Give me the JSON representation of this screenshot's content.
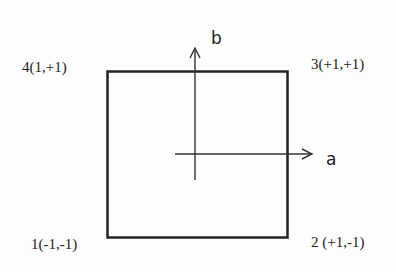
{
  "diagram": {
    "type": "square-with-local-axes",
    "stroke_color": "#222222",
    "background": "#fdfdfd",
    "axes": {
      "horizontal": {
        "label": "a"
      },
      "vertical": {
        "label": "b"
      }
    },
    "corners": [
      {
        "id": 1,
        "position": "bottom-left",
        "label": "1(-1,-1)"
      },
      {
        "id": 2,
        "position": "bottom-right",
        "label": "2 (+1,-1)"
      },
      {
        "id": 3,
        "position": "top-right",
        "label": "3(+1,+1)"
      },
      {
        "id": 4,
        "position": "top-left",
        "label": "4(1,+1)"
      }
    ]
  }
}
